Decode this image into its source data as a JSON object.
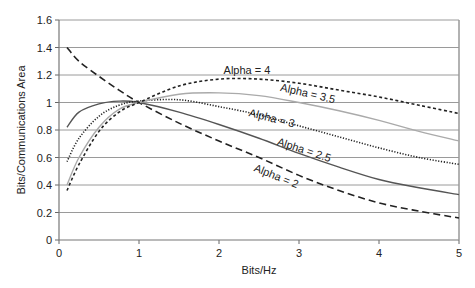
{
  "chart_data": {
    "type": "line",
    "title": "",
    "xlabel": "Bits/Hz",
    "ylabel": "Bits/Communications Area",
    "xlim": [
      0,
      5
    ],
    "ylim": [
      0,
      1.6
    ],
    "x_ticks": [
      "0",
      "1",
      "2",
      "3",
      "4",
      "5"
    ],
    "y_ticks": [
      "0",
      "0.2",
      "0.4",
      "0.6",
      "0.8",
      "1",
      "1.2",
      "1.4",
      "1.6"
    ],
    "grid": "horizontal",
    "legend": "inline labels",
    "x": [
      0.1,
      0.25,
      0.5,
      0.75,
      1.0,
      1.5,
      2.0,
      2.5,
      3.0,
      3.5,
      4.0,
      4.5,
      5.0
    ],
    "series": [
      {
        "name": "Alpha = 2",
        "style": "long-dash",
        "color": "#222222",
        "values": [
          1.4,
          1.3,
          1.19,
          1.09,
          1.0,
          0.85,
          0.72,
          0.6,
          0.47,
          0.36,
          0.27,
          0.21,
          0.16
        ]
      },
      {
        "name": "Alpha = 2.5",
        "style": "solid",
        "color": "#555555",
        "values": [
          0.82,
          0.93,
          0.99,
          1.01,
          1.0,
          0.93,
          0.84,
          0.74,
          0.63,
          0.53,
          0.44,
          0.38,
          0.33
        ]
      },
      {
        "name": "Alpha = 3",
        "style": "dotted",
        "color": "#222222",
        "values": [
          0.57,
          0.74,
          0.9,
          0.98,
          1.01,
          1.02,
          0.97,
          0.91,
          0.83,
          0.75,
          0.67,
          0.6,
          0.55
        ]
      },
      {
        "name": "Alpha = 3.5",
        "style": "solid",
        "color": "#aaaaaa",
        "values": [
          0.4,
          0.6,
          0.82,
          0.95,
          1.0,
          1.06,
          1.07,
          1.05,
          1.0,
          0.94,
          0.87,
          0.79,
          0.72
        ]
      },
      {
        "name": "Alpha = 4",
        "style": "short-dash",
        "color": "#222222",
        "values": [
          0.36,
          0.55,
          0.79,
          0.93,
          1.0,
          1.12,
          1.17,
          1.17,
          1.14,
          1.09,
          1.04,
          0.98,
          0.92
        ]
      }
    ],
    "annotations": [
      {
        "text": "Alpha = 4",
        "x": 2.35,
        "y": 1.21,
        "rotation": 0
      },
      {
        "text": "Alpha = 3.5",
        "x": 3.1,
        "y": 1.04,
        "rotation": 13
      },
      {
        "text": "Alpha = 3",
        "x": 2.65,
        "y": 0.86,
        "rotation": 14
      },
      {
        "text": "Alpha = 2.5",
        "x": 3.05,
        "y": 0.63,
        "rotation": 18
      },
      {
        "text": "Alpha = 2",
        "x": 2.7,
        "y": 0.44,
        "rotation": 22
      }
    ]
  }
}
